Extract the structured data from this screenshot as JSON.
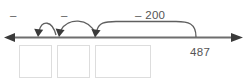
{
  "diagram": {
    "type": "number-line-subtraction",
    "number_line": {
      "left_arrow": "arrow-left",
      "right_arrow": "arrow-right",
      "color": "#6e6e6e"
    },
    "start_value": "487",
    "jumps": [
      {
        "id": "jump-1",
        "label": "–",
        "direction": "left",
        "size": "small"
      },
      {
        "id": "jump-2",
        "label": "–",
        "direction": "left",
        "size": "small"
      },
      {
        "id": "jump-3",
        "label": "– 200",
        "direction": "left",
        "size": "large"
      }
    ],
    "answer_boxes": [
      {
        "id": "answer-box-1",
        "value": ""
      },
      {
        "id": "answer-box-2",
        "value": ""
      },
      {
        "id": "answer-box-3",
        "value": ""
      }
    ],
    "colors": {
      "text": "#555555",
      "line": "#6e6e6e",
      "arc": "#5f5f5f",
      "box_border": "#dddddd",
      "background": "#ffffff"
    }
  }
}
